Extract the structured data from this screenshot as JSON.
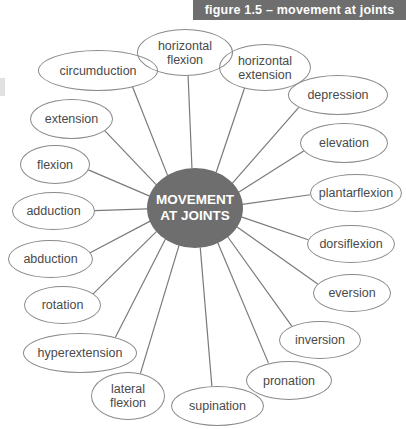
{
  "figure": {
    "header_label": "figure 1.5 – movement at joints",
    "header_color": "#6e6e6e",
    "background_color": "#ffffff"
  },
  "diagram": {
    "type": "radial-mind-map",
    "center": {
      "label": "MOVEMENT\nAT JOINTS",
      "fill_color": "#6e6e6e",
      "text_color": "#ffffff",
      "cx": 195,
      "cy": 208,
      "rx": 48,
      "ry": 40
    },
    "node_stroke_color": "#8a8a8a",
    "node_text_color": "#4a4a4a",
    "edge_color": "#7a7a7a",
    "node_count": 18,
    "nodes": [
      {
        "id": "horizontal-flexion",
        "label": "horizontal\nflexion",
        "x": 137,
        "y": 29,
        "w": 96,
        "h": 47,
        "cx": 185,
        "cy": 52
      },
      {
        "id": "horizontal-extension",
        "label": "horizontal\nextension",
        "x": 219,
        "y": 44,
        "w": 92,
        "h": 47,
        "cx": 265,
        "cy": 67
      },
      {
        "id": "circumduction",
        "label": "circumduction",
        "x": 38,
        "y": 50,
        "w": 120,
        "h": 41,
        "cx": 98,
        "cy": 70
      },
      {
        "id": "depression",
        "label": "depression",
        "x": 288,
        "y": 75,
        "w": 100,
        "h": 40,
        "cx": 338,
        "cy": 95
      },
      {
        "id": "extension",
        "label": "extension",
        "x": 30,
        "y": 99,
        "w": 83,
        "h": 40,
        "cx": 71,
        "cy": 119
      },
      {
        "id": "elevation",
        "label": "elevation",
        "x": 300,
        "y": 123,
        "w": 88,
        "h": 40,
        "cx": 344,
        "cy": 143
      },
      {
        "id": "flexion",
        "label": "flexion",
        "x": 20,
        "y": 145,
        "w": 70,
        "h": 39,
        "cx": 55,
        "cy": 164
      },
      {
        "id": "plantarflexion",
        "label": "plantarflexion",
        "x": 310,
        "y": 174,
        "w": 92,
        "h": 38,
        "cx": 356,
        "cy": 193
      },
      {
        "id": "adduction",
        "label": "adduction",
        "x": 12,
        "y": 192,
        "w": 83,
        "h": 38,
        "cx": 53,
        "cy": 211
      },
      {
        "id": "dorsiflexion",
        "label": "dorsiflexion",
        "x": 307,
        "y": 225,
        "w": 88,
        "h": 38,
        "cx": 351,
        "cy": 244
      },
      {
        "id": "abduction",
        "label": "abduction",
        "x": 8,
        "y": 240,
        "w": 85,
        "h": 38,
        "cx": 50,
        "cy": 259
      },
      {
        "id": "eversion",
        "label": "eversion",
        "x": 313,
        "y": 274,
        "w": 78,
        "h": 38,
        "cx": 352,
        "cy": 293
      },
      {
        "id": "rotation",
        "label": "rotation",
        "x": 24,
        "y": 286,
        "w": 77,
        "h": 38,
        "cx": 62,
        "cy": 305
      },
      {
        "id": "inversion",
        "label": "inversion",
        "x": 279,
        "y": 321,
        "w": 82,
        "h": 38,
        "cx": 320,
        "cy": 340
      },
      {
        "id": "hyperextension",
        "label": "hyperextension",
        "x": 23,
        "y": 333,
        "w": 114,
        "h": 40,
        "cx": 80,
        "cy": 353
      },
      {
        "id": "pronation",
        "label": "pronation",
        "x": 246,
        "y": 361,
        "w": 86,
        "h": 39,
        "cx": 289,
        "cy": 380
      },
      {
        "id": "lateral-flexion",
        "label": "lateral\nflexion",
        "x": 91,
        "y": 372,
        "w": 74,
        "h": 48,
        "cx": 128,
        "cy": 396
      },
      {
        "id": "supination",
        "label": "supination",
        "x": 171,
        "y": 386,
        "w": 93,
        "h": 40,
        "cx": 217,
        "cy": 406
      }
    ]
  }
}
